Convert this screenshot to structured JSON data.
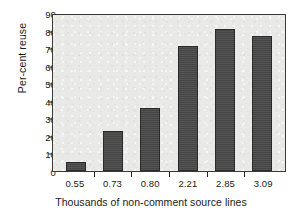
{
  "chart_data": {
    "type": "bar",
    "title": "",
    "categories": [
      "0.55",
      "0.73",
      "0.80",
      "2.21",
      "2.85",
      "3.09"
    ],
    "values": [
      5,
      23,
      36,
      71,
      81,
      77
    ],
    "xlabel": "Thousands of non-comment source lines",
    "ylabel": "Per-cent reuse",
    "ylim": [
      0,
      90
    ],
    "ytick_labels": [
      "0",
      "10",
      "20",
      "30",
      "40",
      "50",
      "60",
      "70",
      "80",
      "90"
    ],
    "ytick_values": [
      0,
      10,
      20,
      30,
      40,
      50,
      60,
      70,
      80,
      90
    ],
    "grid": false,
    "legend": null,
    "legend_position": "none",
    "colors": {
      "bar_fill": "#4a4a4a",
      "bar_edge": "#2a2a2a",
      "plot_background": "#e9e9e7",
      "axis": "#3a3a3a",
      "text": "#1a1a1a",
      "figure_background": "#ffffff"
    }
  }
}
